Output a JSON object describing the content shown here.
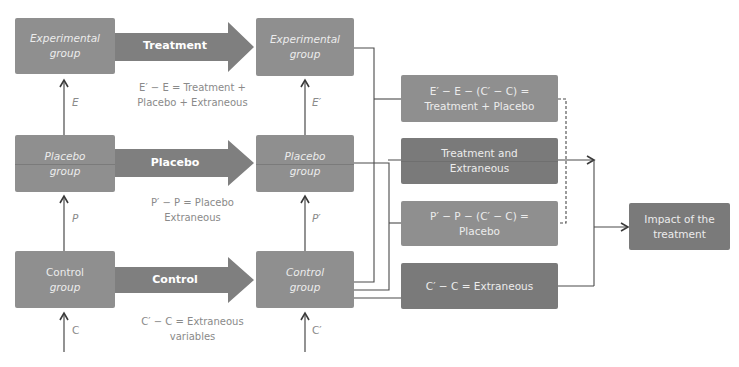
{
  "column1": {
    "experimental": {
      "line1": "Experimental",
      "line2": "group"
    },
    "placebo": {
      "line1": "Placebo",
      "line2": "group"
    },
    "control": {
      "line1": "Control",
      "line2": "group"
    }
  },
  "column2": {
    "experimental": {
      "line1": "Experimental",
      "line2": "group"
    },
    "placebo": {
      "line1": "Placebo",
      "line2": "group"
    },
    "control": {
      "line1": "Control",
      "line2": "group"
    }
  },
  "arrows": {
    "treatment": "Treatment",
    "placebo": "Placebo",
    "control": "Control"
  },
  "equations": {
    "treatment": {
      "line1": "E′ − E = Treatment +",
      "line2": "Placebo + Extraneous"
    },
    "placebo": {
      "line1": "P′ − P = Placebo",
      "line2": "Extraneous"
    },
    "control": {
      "line1": "C′ − C = Extraneous",
      "line2": "variables"
    }
  },
  "variables": {
    "E": "E",
    "E_prime": "E′",
    "P": "P",
    "P_prime": "P′",
    "C": "C",
    "C_prime": "C′"
  },
  "results": {
    "treatment_placebo": {
      "line1": "E′ − E − (C′ − C) =",
      "line2": "Treatment + Placebo"
    },
    "treatment_extraneous": {
      "line1": "Treatment and",
      "line2": "Extraneous"
    },
    "placebo": {
      "line1": "P′ − P − (C′ − C) =",
      "line2": "Placebo"
    },
    "extraneous": {
      "line1": "C′ − C = Extraneous"
    }
  },
  "final": {
    "line1": "Impact of the",
    "line2": "treatment"
  },
  "colors": {
    "box_light": "#8f8f8f",
    "box_dark": "#7a7a7a",
    "arrow_fill": "#7f7f7f",
    "line": "#4a4a4a",
    "equation_text": "#8a8a8a"
  }
}
